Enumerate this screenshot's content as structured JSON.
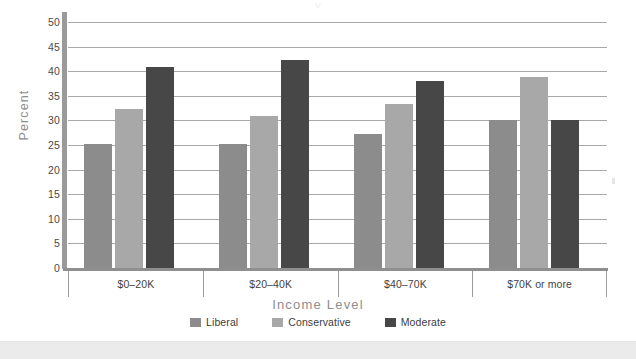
{
  "artifact": {
    "top_text": "y"
  },
  "chart_data": {
    "type": "bar",
    "title": "",
    "xlabel": "Income Level",
    "ylabel": "Percent",
    "categories": [
      "$0–20K",
      "$20–40K",
      "$40–70K",
      "$70K or more"
    ],
    "series": [
      {
        "name": "Liberal",
        "color": "#8c8c8c",
        "values": [
          25.3,
          25.3,
          27.2,
          30.0
        ]
      },
      {
        "name": "Conservative",
        "color": "#a8a8a8",
        "values": [
          32.3,
          30.9,
          33.3,
          38.9
        ]
      },
      {
        "name": "Moderate",
        "color": "#474747",
        "values": [
          40.8,
          42.3,
          38.1,
          30.0
        ]
      }
    ],
    "ylim": [
      0,
      50
    ],
    "yticks": [
      0,
      5,
      10,
      15,
      20,
      25,
      30,
      35,
      40,
      45,
      50
    ],
    "ytick_labels": [
      "0",
      "5",
      "10",
      "15",
      "20",
      "25",
      "30",
      "35",
      "40",
      "45",
      "50"
    ],
    "grid": true,
    "grid_axis": "y",
    "legend_position": "bottom",
    "bar_group_order": [
      "Liberal",
      "Conservative",
      "Moderate"
    ]
  },
  "colors": {
    "gridline": "#a8a8a8",
    "axis_spine": "#9a9a9a",
    "axis_title": "#8e8e8e",
    "tick_label": "#4a4a4a",
    "footer_strip": "#ebebeb",
    "background": "#ffffff"
  }
}
